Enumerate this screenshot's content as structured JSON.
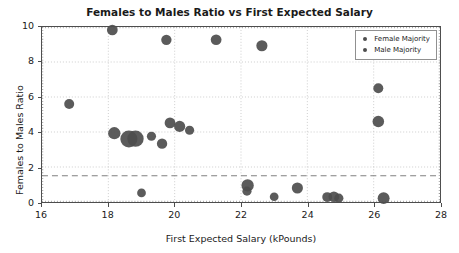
{
  "chart_data": {
    "type": "scatter",
    "title": "Females to Males Ratio vs First Expected Salary",
    "xlabel": "First Expected Salary (kPounds)",
    "ylabel": "Females to Males Ratio",
    "xlim": [
      16,
      28
    ],
    "ylim": [
      0,
      10
    ],
    "xticks": [
      "16",
      "18",
      "20",
      "22",
      "24",
      "26",
      "28"
    ],
    "yticks": [
      "0",
      "2",
      "4",
      "6",
      "8",
      "10"
    ],
    "grid": true,
    "legend_position": "upper right",
    "marker_color": "#4d4d4d",
    "threshold_line": {
      "value": 1.5,
      "style": "dashed",
      "color": "#808080"
    },
    "series": [
      {
        "name": "Female Majority",
        "color": "#4d4d4d",
        "points": [
          {
            "x": 16.82,
            "y": 5.6,
            "size": 5.0
          },
          {
            "x": 18.12,
            "y": 9.83,
            "size": 5.4
          },
          {
            "x": 19.75,
            "y": 9.27,
            "size": 5.2
          },
          {
            "x": 21.25,
            "y": 9.27,
            "size": 5.4
          },
          {
            "x": 22.63,
            "y": 8.93,
            "size": 5.6
          },
          {
            "x": 26.14,
            "y": 6.5,
            "size": 5.0
          },
          {
            "x": 26.14,
            "y": 4.6,
            "size": 5.8
          },
          {
            "x": 18.18,
            "y": 3.93,
            "size": 6.2
          },
          {
            "x": 18.62,
            "y": 3.6,
            "size": 8.6
          },
          {
            "x": 18.82,
            "y": 3.62,
            "size": 8.2
          },
          {
            "x": 19.3,
            "y": 3.76,
            "size": 4.6
          },
          {
            "x": 19.62,
            "y": 3.33,
            "size": 5.2
          },
          {
            "x": 19.86,
            "y": 4.52,
            "size": 5.4
          },
          {
            "x": 20.15,
            "y": 4.32,
            "size": 5.6
          },
          {
            "x": 20.45,
            "y": 4.1,
            "size": 4.6
          }
        ]
      },
      {
        "name": "Male Majority",
        "color": "#4d4d4d",
        "points": [
          {
            "x": 19.0,
            "y": 0.52,
            "size": 4.4
          },
          {
            "x": 22.2,
            "y": 0.95,
            "size": 6.2
          },
          {
            "x": 22.18,
            "y": 0.62,
            "size": 4.6
          },
          {
            "x": 23.0,
            "y": 0.3,
            "size": 4.4
          },
          {
            "x": 23.7,
            "y": 0.8,
            "size": 5.6
          },
          {
            "x": 24.6,
            "y": 0.28,
            "size": 5.0
          },
          {
            "x": 24.8,
            "y": 0.3,
            "size": 5.4
          },
          {
            "x": 24.95,
            "y": 0.22,
            "size": 4.6
          },
          {
            "x": 26.3,
            "y": 0.22,
            "size": 6.0
          }
        ]
      }
    ]
  }
}
